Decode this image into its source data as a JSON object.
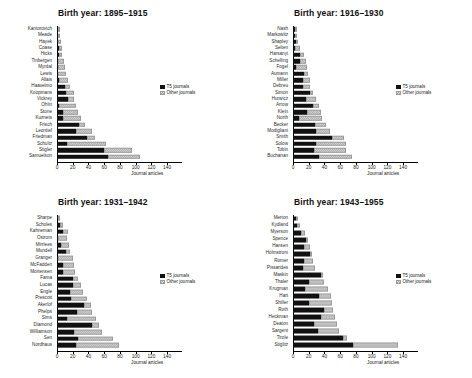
{
  "figure": {
    "xlabel": "Journal articles",
    "legend": {
      "t5": "T5 journals",
      "other": "Other journals"
    },
    "colors": {
      "t5": "#111111",
      "other": "#d8d8d8"
    },
    "caption": ""
  },
  "chart_data": [
    {
      "type": "bar",
      "orientation": "horizontal",
      "stacked": true,
      "title": "Birth year: 1895–1915",
      "xlabel": "Journal articles",
      "ylabel": "",
      "xlim": [
        0,
        150
      ],
      "xticks": [
        0,
        20,
        40,
        60,
        80,
        100,
        120,
        140
      ],
      "grid": false,
      "legend": [
        "T5 journals",
        "Other journals"
      ],
      "legend_position": "right",
      "categories": [
        "Kantorovich",
        "Meade",
        "Hayek",
        "Coase",
        "Hicks",
        "Tinbergen",
        "Myrdal",
        "Lewis",
        "Allais",
        "Haavelmo",
        "Koopmans",
        "Vickrey",
        "Ohlin",
        "Stone",
        "Kuznets",
        "Frisch",
        "Leontief",
        "Friedman",
        "Schultz",
        "Stigler",
        "Samuelson"
      ],
      "series": [
        {
          "name": "T5 journals",
          "values": [
            1,
            1,
            1,
            2,
            2,
            1,
            1,
            1,
            3,
            10,
            11,
            14,
            3,
            8,
            8,
            28,
            24,
            38,
            13,
            60,
            65
          ]
        },
        {
          "name": "Other journals",
          "values": [
            1,
            3,
            4,
            4,
            5,
            8,
            9,
            11,
            11,
            6,
            11,
            8,
            21,
            19,
            23,
            8,
            20,
            10,
            49,
            35,
            40
          ]
        }
      ],
      "totals": [
        2,
        4,
        5,
        6,
        7,
        9,
        10,
        12,
        14,
        16,
        22,
        22,
        24,
        27,
        31,
        36,
        44,
        48,
        62,
        95,
        105
      ]
    },
    {
      "type": "bar",
      "orientation": "horizontal",
      "stacked": true,
      "title": "Birth year: 1916–1930",
      "xlabel": "Journal articles",
      "ylabel": "",
      "xlim": [
        0,
        150
      ],
      "xticks": [
        0,
        20,
        40,
        60,
        80,
        100,
        120,
        140
      ],
      "grid": false,
      "legend": [
        "T5 journals",
        "Other journals"
      ],
      "legend_position": "right",
      "categories": [
        "Nash",
        "Markowitz",
        "Shapley",
        "Selten",
        "Harsanyi",
        "Schelling",
        "Fogel",
        "Aumann",
        "Miller",
        "Debreu",
        "Simon",
        "Hurwicz",
        "Arrow",
        "Klein",
        "North",
        "Becker",
        "Modigliani",
        "Smith",
        "Solow",
        "Tobin",
        "Buchanan"
      ],
      "series": [
        {
          "name": "T5 journals",
          "values": [
            2,
            2,
            4,
            2,
            9,
            9,
            4,
            14,
            13,
            13,
            21,
            16,
            25,
            18,
            7,
            28,
            29,
            49,
            29,
            27,
            33
          ]
        },
        {
          "name": "Other journals",
          "values": [
            0,
            2,
            2,
            7,
            5,
            8,
            14,
            5,
            8,
            9,
            5,
            13,
            8,
            17,
            30,
            14,
            18,
            16,
            38,
            40,
            42
          ]
        }
      ],
      "totals": [
        2,
        4,
        6,
        9,
        14,
        17,
        18,
        19,
        21,
        22,
        26,
        29,
        33,
        35,
        37,
        42,
        47,
        65,
        67,
        67,
        75
      ]
    },
    {
      "type": "bar",
      "orientation": "horizontal",
      "stacked": true,
      "title": "Birth year: 1931–1942",
      "xlabel": "Journal articles",
      "ylabel": "",
      "xlim": [
        0,
        150
      ],
      "xticks": [
        0,
        20,
        40,
        60,
        80,
        100,
        120,
        140
      ],
      "grid": false,
      "legend": [
        "T5 journals",
        "Other journals"
      ],
      "legend_position": "right",
      "categories": [
        "Sharpe",
        "Scholes",
        "Kahneman",
        "Ostrom",
        "Mirrlees",
        "Mundell",
        "Granger",
        "McFadden",
        "Mortensen",
        "Fama",
        "Lucas",
        "Engle",
        "Prescott",
        "Akerlof",
        "Phelps",
        "Sims",
        "Diamond",
        "Williamson",
        "Sen",
        "Nordhaus"
      ],
      "series": [
        {
          "name": "T5 journals",
          "values": [
            1,
            4,
            7,
            1,
            5,
            11,
            1,
            8,
            8,
            20,
            20,
            16,
            18,
            34,
            25,
            13,
            44,
            22,
            27,
            24
          ]
        },
        {
          "name": "Other journals",
          "values": [
            0,
            3,
            7,
            12,
            10,
            6,
            19,
            13,
            15,
            7,
            11,
            17,
            20,
            9,
            20,
            36,
            9,
            35,
            44,
            55
          ]
        }
      ],
      "totals": [
        1,
        7,
        14,
        13,
        15,
        17,
        20,
        21,
        23,
        27,
        31,
        33,
        38,
        43,
        45,
        49,
        53,
        57,
        71,
        79
      ]
    },
    {
      "type": "bar",
      "orientation": "horizontal",
      "stacked": true,
      "title": "Birth year: 1943–1955",
      "xlabel": "Journal articles",
      "ylabel": "",
      "xlim": [
        0,
        150
      ],
      "xticks": [
        0,
        20,
        40,
        60,
        80,
        100,
        120,
        140
      ],
      "grid": false,
      "legend": [
        "T5 journals",
        "Other journals"
      ],
      "legend_position": "right",
      "categories": [
        "Merton",
        "Kydland",
        "Myerson",
        "Spence",
        "Hansen",
        "Holmstrom",
        "Romer",
        "Pissarides",
        "Maskin",
        "Thaler",
        "Krugman",
        "Hart",
        "Shiller",
        "Roth",
        "Heckman",
        "Deaton",
        "Sargent",
        "Tirole",
        "Stiglitz"
      ],
      "series": [
        {
          "name": "T5 journals",
          "values": [
            4,
            5,
            10,
            16,
            14,
            21,
            14,
            13,
            35,
            20,
            15,
            33,
            20,
            39,
            36,
            27,
            32,
            64,
            76
          ]
        },
        {
          "name": "Other journals",
          "values": [
            1,
            4,
            5,
            3,
            7,
            3,
            12,
            15,
            3,
            19,
            30,
            15,
            29,
            12,
            18,
            29,
            27,
            5,
            57
          ]
        }
      ],
      "totals": [
        5,
        9,
        15,
        19,
        21,
        24,
        26,
        28,
        38,
        39,
        45,
        48,
        49,
        51,
        54,
        56,
        59,
        69,
        133
      ]
    }
  ]
}
